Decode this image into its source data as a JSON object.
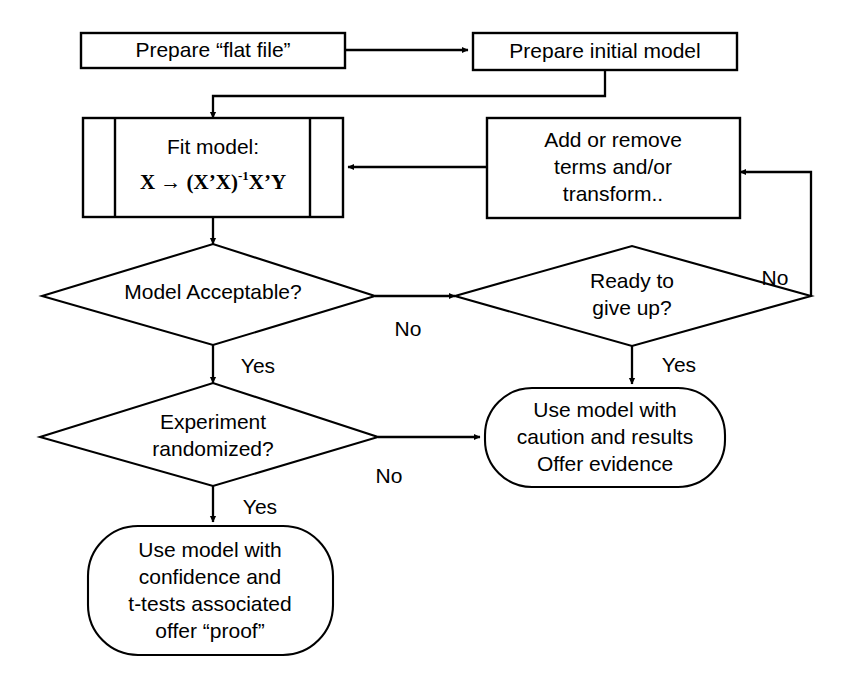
{
  "diagram": {
    "colors": {
      "stroke": "#000000",
      "fill": "#ffffff",
      "background": "#ffffff"
    },
    "nodes": {
      "prepare_flat_file": {
        "shape": "process",
        "lines": [
          "Prepare “flat file”"
        ]
      },
      "prepare_initial_model": {
        "shape": "process",
        "lines": [
          "Prepare initial model"
        ]
      },
      "fit_model": {
        "shape": "predefined-process",
        "lines": [
          "Fit model:"
        ],
        "formula_parts": {
          "lead": "X → (X’X)",
          "exponent": "-1",
          "tail": "X’Y"
        }
      },
      "add_or_remove": {
        "shape": "process",
        "lines": [
          "Add or remove",
          "terms and/or",
          "transform.."
        ]
      },
      "model_acceptable": {
        "shape": "decision",
        "lines": [
          "Model Acceptable?"
        ]
      },
      "ready_to_give_up": {
        "shape": "decision",
        "lines": [
          "Ready to",
          "give up?"
        ]
      },
      "experiment_randomized": {
        "shape": "decision",
        "lines": [
          "Experiment",
          "randomized?"
        ]
      },
      "use_with_caution": {
        "shape": "terminator",
        "lines": [
          "Use model with",
          "caution and results",
          "Offer evidence"
        ]
      },
      "use_with_confidence": {
        "shape": "terminator",
        "lines": [
          "Use model with",
          "confidence and",
          "t-tests associated",
          "offer “proof”"
        ]
      }
    },
    "edge_labels": {
      "model_acceptable_no": "No",
      "model_acceptable_yes": "Yes",
      "ready_give_up_no": "No",
      "ready_give_up_yes": "Yes",
      "experiment_no": "No",
      "experiment_yes": "Yes"
    }
  }
}
